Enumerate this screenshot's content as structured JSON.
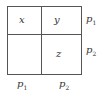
{
  "diagram": {
    "cells": {
      "top_left": "x",
      "top_right": "y",
      "bottom_left": "",
      "bottom_right": "z"
    },
    "row_labels": [
      {
        "base": "p",
        "sub": "1"
      },
      {
        "base": "p",
        "sub": "2"
      }
    ],
    "col_labels": [
      {
        "base": "p",
        "sub": "1"
      },
      {
        "base": "p",
        "sub": "2"
      }
    ]
  }
}
